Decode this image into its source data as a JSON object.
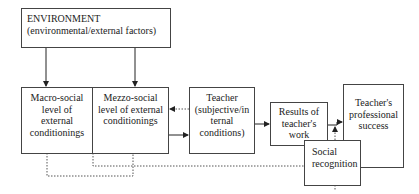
{
  "diagram": {
    "nodes": {
      "environment": {
        "title": "ENVIRONMENT",
        "subtitle": "(environmental/external factors)"
      },
      "macro": {
        "label": "Macro-social level of external conditionings"
      },
      "mezzo": {
        "label": "Mezzo-social level of external conditionings"
      },
      "teacher": {
        "label": "Teacher (subjective/in ternal conditions)"
      },
      "results": {
        "label": "Results of teacher's work"
      },
      "success": {
        "label": "Teacher's professional success"
      },
      "social": {
        "label": "Social recognition"
      }
    },
    "edges": [
      {
        "from": "environment",
        "to": "macro",
        "style": "solid"
      },
      {
        "from": "environment",
        "to": "mezzo",
        "style": "solid"
      },
      {
        "from": "mezzo",
        "to": "teacher",
        "style": "solid"
      },
      {
        "from": "teacher",
        "to": "mezzo",
        "style": "dotted"
      },
      {
        "from": "teacher",
        "to": "results",
        "style": "solid"
      },
      {
        "from": "results",
        "to": "success",
        "style": "solid"
      },
      {
        "from": "social",
        "to": "results",
        "style": "dotted"
      },
      {
        "from": "macro",
        "to": "mezzo",
        "style": "dotted"
      },
      {
        "from": "mezzo",
        "to": "social",
        "style": "dotted"
      },
      {
        "from": "social",
        "to": "success",
        "style": "solid"
      }
    ]
  }
}
